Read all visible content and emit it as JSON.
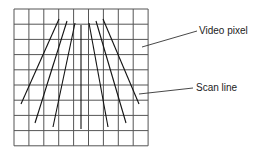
{
  "diagram": {
    "grid": {
      "x": 14,
      "y": 9,
      "cols": 9,
      "rows": 9,
      "cell_w": 14.9,
      "cell_h": 15.2,
      "color": "#444444"
    },
    "scan_lines": [
      {
        "x1": 59,
        "y1": 19,
        "x2": 21,
        "y2": 104
      },
      {
        "x1": 67,
        "y1": 21,
        "x2": 35,
        "y2": 123
      },
      {
        "x1": 75,
        "y1": 23,
        "x2": 53,
        "y2": 127
      },
      {
        "x1": 81,
        "y1": 25,
        "x2": 81,
        "y2": 129
      },
      {
        "x1": 89,
        "y1": 23,
        "x2": 108,
        "y2": 127
      },
      {
        "x1": 96,
        "y1": 21,
        "x2": 126,
        "y2": 123
      },
      {
        "x1": 103,
        "y1": 19,
        "x2": 139,
        "y2": 104
      }
    ],
    "labels": [
      {
        "text": "Video pixel",
        "x": 199,
        "y": 25,
        "lx1": 142,
        "ly1": 47,
        "lx2": 197,
        "ly2": 31
      },
      {
        "text": "Scan line",
        "x": 196,
        "y": 82,
        "lx1": 139,
        "ly1": 94,
        "lx2": 193,
        "ly2": 88
      }
    ]
  }
}
